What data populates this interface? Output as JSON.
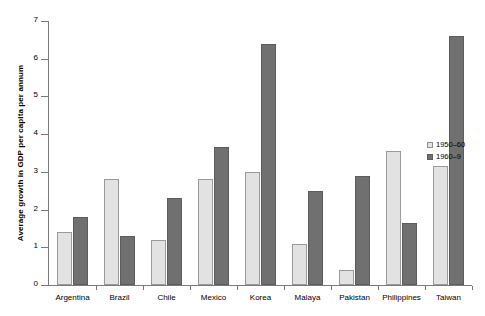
{
  "chart_data": {
    "type": "bar",
    "title": "",
    "subtitle": "",
    "xlabel": "",
    "ylabel": "Average growth in GDP per capita per annum",
    "categories": [
      "Argentina",
      "Brazil",
      "Chile",
      "Mexico",
      "Korea",
      "Malaya",
      "Pakistan",
      "Philippines",
      "Taiwan"
    ],
    "series": [
      {
        "name": "1950–60",
        "color": "#e2e2e2",
        "values": [
          1.4,
          2.8,
          1.2,
          2.8,
          3.0,
          1.1,
          0.4,
          3.55,
          3.15
        ]
      },
      {
        "name": "1960–9",
        "color": "#707070",
        "values": [
          1.8,
          1.3,
          2.3,
          3.65,
          6.4,
          2.5,
          2.9,
          1.65,
          6.6
        ]
      }
    ],
    "ylim": [
      0,
      7
    ],
    "yticks": [
      0,
      1,
      2,
      3,
      4,
      5,
      6,
      7
    ],
    "ytick_labels": [
      "0",
      "1",
      "2",
      "3",
      "4",
      "5",
      "6",
      "7"
    ],
    "grid": false,
    "legend_position": "right"
  },
  "legend": {
    "items": [
      {
        "label": "1950–60",
        "swatch": "light"
      },
      {
        "label": "1960–9",
        "swatch": "dark"
      }
    ]
  }
}
